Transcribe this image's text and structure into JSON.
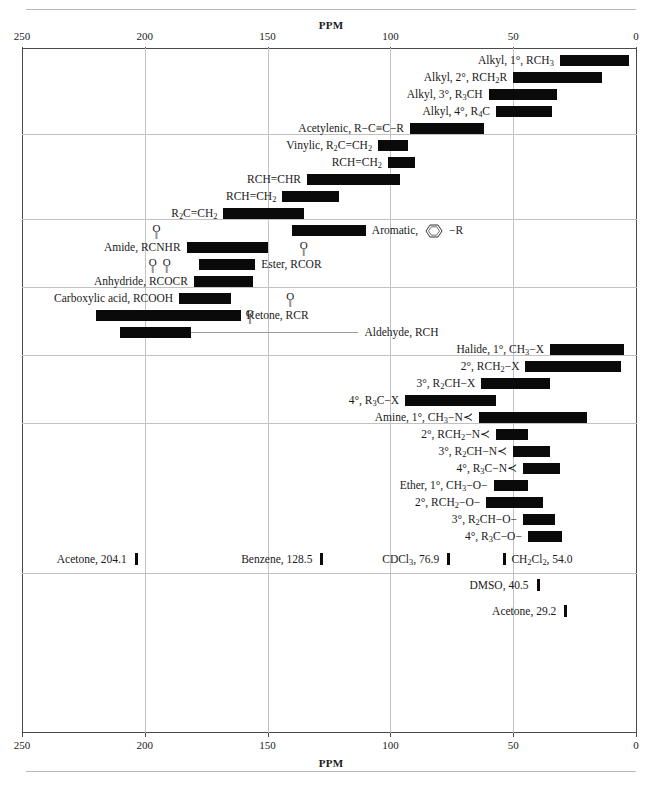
{
  "page": {
    "heading_top": "PPM",
    "heading_bottom": "PPM"
  },
  "chart_data": {
    "type": "bar",
    "title": "PPM",
    "xlabel": "PPM",
    "ylabel": "",
    "orientation": "horizontal",
    "xlim": [
      250,
      0
    ],
    "x_reversed": true,
    "grid": true,
    "legend": false,
    "tick_values": [
      250,
      200,
      150,
      100,
      50,
      0
    ],
    "tick_labels": [
      "250",
      "200",
      "150",
      "100",
      "50",
      "0"
    ],
    "section_breaks_ppm_rows": [
      5,
      10,
      14,
      18,
      22
    ],
    "bars": [
      {
        "label": "Alkyl, 1°, RCH₃",
        "label_html": "Alkyl, 1°, RCH<sub>3</sub>",
        "start_ppm": 31,
        "end_ppm": 3,
        "label_side": "right",
        "group": "alkyl"
      },
      {
        "label": "Alkyl, 2°, RCH₂R",
        "label_html": "Alkyl, 2°, RCH<sub>2</sub>R",
        "start_ppm": 50,
        "end_ppm": 14,
        "label_side": "right",
        "group": "alkyl"
      },
      {
        "label": "Alkyl, 3°, R₃CH",
        "label_html": "Alkyl, 3°, R<sub>3</sub>CH",
        "start_ppm": 60,
        "end_ppm": 32,
        "label_side": "right",
        "group": "alkyl"
      },
      {
        "label": "Alkyl, 4°, R₄C",
        "label_html": "Alkyl, 4°, R<sub>4</sub>C",
        "start_ppm": 57,
        "end_ppm": 34,
        "label_side": "right",
        "group": "alkyl"
      },
      {
        "label": "Acetylenic, R−C≡C−R",
        "label_html": "Acetylenic, R−C≡C−R",
        "start_ppm": 92,
        "end_ppm": 62,
        "label_side": "right",
        "group": "alkyl"
      },
      {
        "label": "Vinylic, R₂C=CH₂",
        "label_html": "Vinylic, R<sub>2</sub>C=CH<sub>2</sub>",
        "start_ppm": 105,
        "end_ppm": 93,
        "label_side": "right",
        "group": "vinylic"
      },
      {
        "label": "RCH=CH₂",
        "label_html": "RCH=CH<sub>2</sub>",
        "start_ppm": 101,
        "end_ppm": 90,
        "label_side": "right",
        "group": "vinylic"
      },
      {
        "label": "RCH=CHR",
        "label_html": "RCH=CHR",
        "start_ppm": 134,
        "end_ppm": 96,
        "label_side": "right",
        "group": "vinylic"
      },
      {
        "label": "RCH=CH₂",
        "label_html": "RCH=CH<sub>2</sub>",
        "start_ppm": 144,
        "end_ppm": 121,
        "label_side": "right",
        "group": "vinylic"
      },
      {
        "label": "R₂C=CH₂",
        "label_html": "R<sub>2</sub>C=CH<sub>2</sub>",
        "start_ppm": 168,
        "end_ppm": 135,
        "label_side": "right",
        "group": "vinylic"
      },
      {
        "label": "Aromatic, C₆H₅−R",
        "label_html": "Aromatic,",
        "start_ppm": 140,
        "end_ppm": 110,
        "label_side": "left",
        "group": "aromatic",
        "has_ring": true
      },
      {
        "label": "Amide, RCONHR",
        "label_html": "Amide, RCNHR",
        "start_ppm": 183,
        "end_ppm": 150,
        "label_side": "right",
        "group": "aromatic",
        "carbonyl": "single"
      },
      {
        "label": "Ester, RCOOR",
        "label_html": "Ester, RCOR",
        "start_ppm": 178,
        "end_ppm": 155,
        "label_side": "left",
        "group": "aromatic",
        "carbonyl": "single"
      },
      {
        "label": "Anhydride, RCOOCR",
        "label_html": "Anhydride, RCOCR",
        "start_ppm": 180,
        "end_ppm": 156,
        "label_side": "right",
        "group": "aromatic",
        "carbonyl": "double"
      },
      {
        "label": "Carboxylic acid, RCOOH",
        "label_html": "Carboxylic acid, RCOOH",
        "start_ppm": 186,
        "end_ppm": 165,
        "label_side": "right",
        "group": "aromatic"
      },
      {
        "label": "Ketone, RCOR",
        "label_html": "Ketone, RCR",
        "start_ppm": 220,
        "end_ppm": 161,
        "label_side": "left",
        "group": "carbonyl",
        "carbonyl": "single"
      },
      {
        "label": "Aldehyde, RCHO",
        "label_html": "Aldehyde, RCH",
        "start_ppm": 210,
        "end_ppm": 181,
        "label_side": "left",
        "group": "carbonyl",
        "carbonyl": "single",
        "leader": true
      },
      {
        "label": "Halide, 1°, CH₃−X",
        "label_html": "Halide, 1°, CH<sub>3</sub>−X",
        "start_ppm": 35,
        "end_ppm": 5,
        "label_side": "right",
        "group": "halide"
      },
      {
        "label": "2°, RCH₂−X",
        "label_html": "2°, RCH<sub>2</sub>−X",
        "start_ppm": 45,
        "end_ppm": 6,
        "label_side": "right",
        "group": "halide"
      },
      {
        "label": "3°, R₂CH−X",
        "label_html": "3°, R<sub>2</sub>CH−X",
        "start_ppm": 63,
        "end_ppm": 35,
        "label_side": "right",
        "group": "halide"
      },
      {
        "label": "4°, R₃C−X",
        "label_html": "4°, R<sub>3</sub>C−X",
        "start_ppm": 94,
        "end_ppm": 57,
        "label_side": "right",
        "group": "halide"
      },
      {
        "label": "Amine, 1°, CH₃−N<",
        "label_html": "Amine, 1°, CH<sub>3</sub>−N≺",
        "start_ppm": 64,
        "end_ppm": 20,
        "label_side": "right",
        "group": "amine"
      },
      {
        "label": "2°, RCH₂−N<",
        "label_html": "2°, RCH<sub>2</sub>−N≺",
        "start_ppm": 57,
        "end_ppm": 44,
        "label_side": "right",
        "group": "amine"
      },
      {
        "label": "3°, R₂CH−N<",
        "label_html": "3°, R<sub>2</sub>CH−N≺",
        "start_ppm": 50,
        "end_ppm": 35,
        "label_side": "right",
        "group": "amine"
      },
      {
        "label": "4°, R₃C−N<",
        "label_html": "4°, R<sub>3</sub>C−N≺",
        "start_ppm": 46,
        "end_ppm": 31,
        "label_side": "right",
        "group": "amine"
      },
      {
        "label": "Ether, 1°, CH₃−O−",
        "label_html": "Ether, 1°, CH<sub>3</sub>−O−",
        "start_ppm": 58,
        "end_ppm": 44,
        "label_side": "right",
        "group": "ether"
      },
      {
        "label": "2°, RCH₂−O−",
        "label_html": "2°, RCH<sub>2</sub>−O−",
        "start_ppm": 61,
        "end_ppm": 38,
        "label_side": "right",
        "group": "ether"
      },
      {
        "label": "3°, R₂CH−O−",
        "label_html": "3°, R<sub>2</sub>CH−O−",
        "start_ppm": 46,
        "end_ppm": 33,
        "label_side": "right",
        "group": "ether"
      },
      {
        "label": "4°, R₃C−O−",
        "label_html": "4°, R<sub>3</sub>C−O−",
        "start_ppm": 44,
        "end_ppm": 30,
        "label_side": "right",
        "group": "ether"
      }
    ],
    "solvent_references": [
      {
        "label": "Acetone, 204.1",
        "label_html": "Acetone, 204.1",
        "ppm": 204.1,
        "row": 0,
        "text_side": "left"
      },
      {
        "label": "Benzene, 128.5",
        "label_html": "Benzene, 128.5",
        "ppm": 128.5,
        "row": 0,
        "text_side": "left"
      },
      {
        "label": "CDCl3, 76.9",
        "label_html": "CDCl<sub>3</sub>, 76.9",
        "ppm": 76.9,
        "row": 0,
        "text_side": "left"
      },
      {
        "label": "CH2Cl2, 54.0",
        "label_html": "CH<sub>2</sub>Cl<sub>2</sub>, 54.0",
        "ppm": 54.0,
        "row": 0,
        "text_side": "right"
      },
      {
        "label": "DMSO, 40.5",
        "label_html": "DMSO, 40.5",
        "ppm": 40.5,
        "row": 1,
        "text_side": "left"
      },
      {
        "label": "Acetone, 29.2",
        "label_html": "Acetone, 29.2",
        "ppm": 29.2,
        "row": 2,
        "text_side": "left"
      }
    ]
  }
}
